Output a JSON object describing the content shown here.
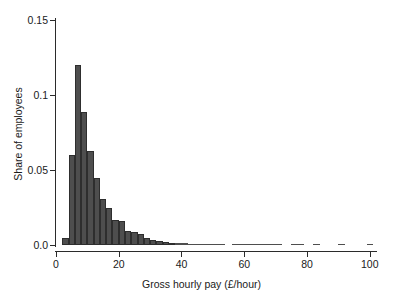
{
  "chart_data": {
    "type": "bar",
    "title": "",
    "subtitle": "",
    "xlabel": "Gross hourly pay (£/hour)",
    "ylabel": "Share of employees",
    "xlim": [
      0,
      102
    ],
    "ylim": [
      0.0,
      0.15
    ],
    "grid": false,
    "legend": null,
    "bin_width": 2,
    "bar_color": "#4e4e4e",
    "bar_edge_color": "#2e2e2e",
    "axis_color": "#2b2b2b",
    "xticks": [
      {
        "value": 0,
        "label": "0"
      },
      {
        "value": 20,
        "label": "20"
      },
      {
        "value": 40,
        "label": "40"
      },
      {
        "value": 60,
        "label": "60"
      },
      {
        "value": 80,
        "label": "80"
      },
      {
        "value": 100,
        "label": "100"
      }
    ],
    "yticks": [
      {
        "value": 0.0,
        "label": "0.0"
      },
      {
        "value": 0.05,
        "label": "0.05"
      },
      {
        "value": 0.1,
        "label": "0.1"
      },
      {
        "value": 0.15,
        "label": "0.15"
      }
    ],
    "bins": [
      {
        "x0": 2,
        "x1": 4,
        "value": 0.005
      },
      {
        "x0": 4,
        "x1": 6,
        "value": 0.06
      },
      {
        "x0": 6,
        "x1": 8,
        "value": 0.12
      },
      {
        "x0": 8,
        "x1": 10,
        "value": 0.089
      },
      {
        "x0": 10,
        "x1": 12,
        "value": 0.063
      },
      {
        "x0": 12,
        "x1": 14,
        "value": 0.045
      },
      {
        "x0": 14,
        "x1": 16,
        "value": 0.031
      },
      {
        "x0": 16,
        "x1": 18,
        "value": 0.025
      },
      {
        "x0": 18,
        "x1": 20,
        "value": 0.017
      },
      {
        "x0": 20,
        "x1": 22,
        "value": 0.016
      },
      {
        "x0": 22,
        "x1": 24,
        "value": 0.0095
      },
      {
        "x0": 24,
        "x1": 26,
        "value": 0.0085
      },
      {
        "x0": 26,
        "x1": 28,
        "value": 0.0075
      },
      {
        "x0": 28,
        "x1": 30,
        "value": 0.0045
      },
      {
        "x0": 30,
        "x1": 32,
        "value": 0.0035
      },
      {
        "x0": 32,
        "x1": 34,
        "value": 0.003
      },
      {
        "x0": 34,
        "x1": 36,
        "value": 0.0022
      },
      {
        "x0": 36,
        "x1": 38,
        "value": 0.0015
      },
      {
        "x0": 38,
        "x1": 40,
        "value": 0.0013
      },
      {
        "x0": 40,
        "x1": 42,
        "value": 0.0012
      },
      {
        "x0": 42,
        "x1": 44,
        "value": 0.001
      },
      {
        "x0": 44,
        "x1": 46,
        "value": 0.0009
      },
      {
        "x0": 46,
        "x1": 48,
        "value": 0.0008
      },
      {
        "x0": 48,
        "x1": 50,
        "value": 0.0007
      },
      {
        "x0": 50,
        "x1": 52,
        "value": 0.0006
      },
      {
        "x0": 52,
        "x1": 54,
        "value": 0.0006
      },
      {
        "x0": 56,
        "x1": 58,
        "value": 0.0005
      },
      {
        "x0": 58,
        "x1": 60,
        "value": 0.0005
      },
      {
        "x0": 60,
        "x1": 62,
        "value": 0.0004
      },
      {
        "x0": 62,
        "x1": 64,
        "value": 0.0004
      },
      {
        "x0": 64,
        "x1": 66,
        "value": 0.0004
      },
      {
        "x0": 66,
        "x1": 68,
        "value": 0.0003
      },
      {
        "x0": 68,
        "x1": 70,
        "value": 0.0003
      },
      {
        "x0": 70,
        "x1": 72,
        "value": 0.0003
      },
      {
        "x0": 75,
        "x1": 77,
        "value": 0.0003
      },
      {
        "x0": 77,
        "x1": 79,
        "value": 0.0003
      },
      {
        "x0": 82,
        "x1": 84,
        "value": 0.0003
      },
      {
        "x0": 90,
        "x1": 92,
        "value": 0.0002
      },
      {
        "x0": 99,
        "x1": 101,
        "value": 0.0003
      }
    ]
  }
}
